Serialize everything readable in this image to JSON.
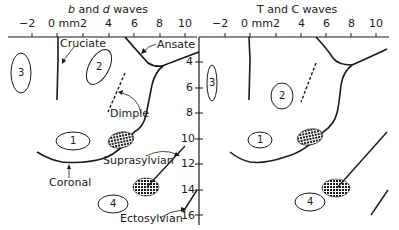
{
  "panels": [
    {
      "title_parts": [
        "b",
        " and ",
        "d",
        " waves"
      ],
      "x_ticks": [
        "−2",
        "0 mm",
        "2",
        "4",
        "6",
        "8",
        "10"
      ],
      "labels": {
        "cruciate": "Cruciate",
        "ansate": "Ansate",
        "dimple": "Dimple",
        "coronal": "Coronal",
        "suprasylvian": "Suprasylvian",
        "ectosylvian": "Ectosylvian"
      },
      "regions": [
        "1",
        "2",
        "3",
        "4"
      ]
    },
    {
      "title": "T and C waves",
      "x_ticks": [
        "−2",
        "0 mm",
        "2",
        "4",
        "6",
        "8",
        "10"
      ],
      "regions": [
        "1",
        "2",
        "3",
        "4"
      ]
    }
  ],
  "y_axis": {
    "ticks": [
      "4",
      "6",
      "8",
      "10",
      "12",
      "14",
      "16"
    ]
  },
  "colors": {
    "ink": "#1a1a1a",
    "background": "#ffffff"
  }
}
